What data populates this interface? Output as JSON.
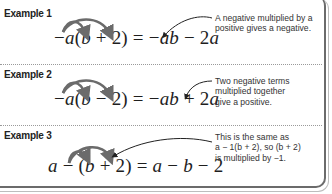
{
  "examples": [
    {
      "label": "Example 1",
      "equation": {
        "lhs": [
          "−",
          "a",
          "(",
          "b",
          " + 2) = ",
          "−",
          "ab",
          " − 2",
          "a"
        ],
        "text": "−a(b + 2) = −ab − 2a"
      },
      "note": [
        "A negative multiplied by a",
        "positive gives a negative."
      ]
    },
    {
      "label": "Example 2",
      "equation": {
        "text": "−a(b − 2) = −ab + 2a"
      },
      "note": [
        "Two negative terms",
        "multiplied together",
        "give a positive."
      ]
    },
    {
      "label": "Example 3",
      "equation": {
        "text": "a − (b + 2) = a − b − 2"
      },
      "note": [
        "This is the same as",
        "a − 1(b + 2), so (b + 2)",
        "is multiplied by −1."
      ]
    }
  ],
  "colors": {
    "arrow": "#6b6b6b",
    "text": "#1e1e1e",
    "frame": "#6b6b6b"
  }
}
